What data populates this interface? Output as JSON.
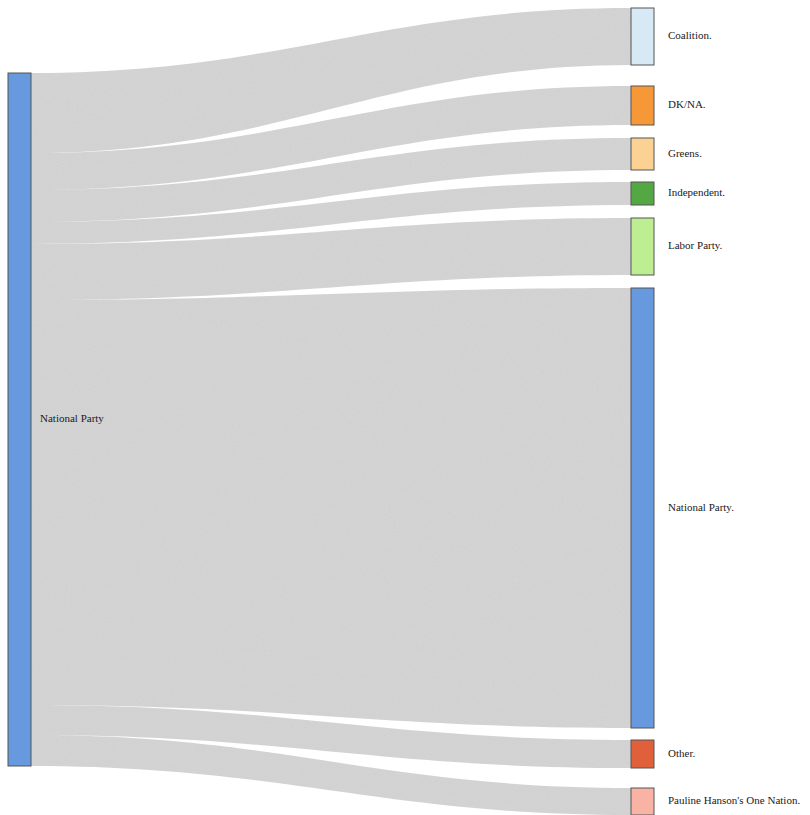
{
  "chart_data": {
    "type": "sankey",
    "title": "",
    "subtitle": "",
    "xlabel": "",
    "ylabel": "",
    "grid": false,
    "legend_position": "none",
    "source_label_suffix": "",
    "target_label_suffix": ".",
    "nodes": [
      {
        "id": "src-national-party",
        "label": "National Party",
        "side": "left",
        "color": "#6699dd",
        "x": 8,
        "y": 73,
        "width": 23,
        "height": 693
      },
      {
        "id": "tgt-coalition",
        "label": "Coalition.",
        "side": "right",
        "color": "#d6e9f5",
        "x": 631,
        "y": 8,
        "width": 23,
        "height": 57
      },
      {
        "id": "tgt-dkna",
        "label": "DK/NA.",
        "side": "right",
        "color": "#f79838",
        "x": 631,
        "y": 86,
        "width": 23,
        "height": 39
      },
      {
        "id": "tgt-greens",
        "label": "Greens.",
        "side": "right",
        "color": "#fbd293",
        "x": 631,
        "y": 138,
        "width": 23,
        "height": 32
      },
      {
        "id": "tgt-independent",
        "label": "Independent.",
        "side": "right",
        "color": "#54a844",
        "x": 631,
        "y": 182,
        "width": 23,
        "height": 23
      },
      {
        "id": "tgt-labor-party",
        "label": "Labor Party.",
        "side": "right",
        "color": "#bdee92",
        "x": 631,
        "y": 218,
        "width": 23,
        "height": 57
      },
      {
        "id": "tgt-national-party",
        "label": "National Party.",
        "side": "right",
        "color": "#6699dd",
        "x": 631,
        "y": 288,
        "width": 23,
        "height": 440
      },
      {
        "id": "tgt-other",
        "label": "Other.",
        "side": "right",
        "color": "#e0603c",
        "x": 631,
        "y": 740,
        "width": 23,
        "height": 28
      },
      {
        "id": "tgt-one-nation",
        "label": "Pauline Hanson's One Nation.",
        "side": "right",
        "color": "#f9b3a5",
        "x": 631,
        "y": 788,
        "width": 23,
        "height": 27
      }
    ],
    "links": [
      {
        "source": "src-national-party",
        "target": "tgt-coalition",
        "source_y0": 73,
        "source_y1": 153,
        "target_y0": 8,
        "target_y1": 65,
        "color": "#c8c8c8"
      },
      {
        "source": "src-national-party",
        "target": "tgt-dkna",
        "source_y0": 153,
        "source_y1": 190,
        "target_y0": 86,
        "target_y1": 125,
        "color": "#c8c8c8"
      },
      {
        "source": "src-national-party",
        "target": "tgt-greens",
        "source_y0": 190,
        "source_y1": 222,
        "target_y0": 138,
        "target_y1": 170,
        "color": "#c8c8c8"
      },
      {
        "source": "src-national-party",
        "target": "tgt-independent",
        "source_y0": 222,
        "source_y1": 244,
        "target_y0": 182,
        "target_y1": 205,
        "color": "#c8c8c8"
      },
      {
        "source": "src-national-party",
        "target": "tgt-labor-party",
        "source_y0": 244,
        "source_y1": 300,
        "target_y0": 218,
        "target_y1": 275,
        "color": "#c8c8c8"
      },
      {
        "source": "src-national-party",
        "target": "tgt-national-party",
        "source_y0": 300,
        "source_y1": 705,
        "target_y0": 288,
        "target_y1": 728,
        "color": "#c8c8c8"
      },
      {
        "source": "src-national-party",
        "target": "tgt-other",
        "source_y0": 705,
        "source_y1": 735,
        "target_y0": 740,
        "target_y1": 768,
        "color": "#c8c8c8"
      },
      {
        "source": "src-national-party",
        "target": "tgt-one-nation",
        "source_y0": 735,
        "source_y1": 766,
        "target_y0": 788,
        "target_y1": 815,
        "color": "#c8c8c8"
      }
    ],
    "label_x_right": 668,
    "label_x_left": 40
  },
  "colors": {
    "link": "#c8c8c8",
    "node_stroke": "#555555",
    "background": "#ffffff",
    "text": "#1a1a1a"
  }
}
